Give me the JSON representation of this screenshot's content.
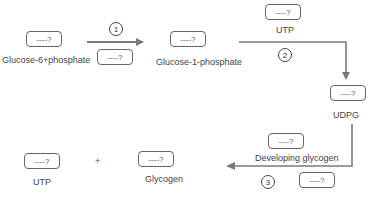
{
  "diagram": {
    "placeholder": "----?",
    "nodes": {
      "glucose6p": {
        "label": "Glucose-6+phosphate",
        "box": "----?"
      },
      "step1_box": {
        "box": "----?"
      },
      "glucose1p": {
        "label": "Glucose-1-phosphate",
        "box": "----?"
      },
      "utp_top": {
        "label": "UTP",
        "box": "----?"
      },
      "udpg": {
        "label": "UDPG",
        "box": "----?"
      },
      "developing": {
        "label": "Developing glycogen",
        "box": "----?"
      },
      "step3_box": {
        "box": "----?"
      },
      "utp_bottom": {
        "label": "UTP",
        "box": "----?"
      },
      "glycogen": {
        "label": "Glycogen",
        "box": "----?"
      }
    },
    "steps": [
      "1",
      "2",
      "3"
    ],
    "plus": "+",
    "colors": {
      "line": "#7a7a7a",
      "border": "#666666",
      "text": "#444444"
    }
  }
}
